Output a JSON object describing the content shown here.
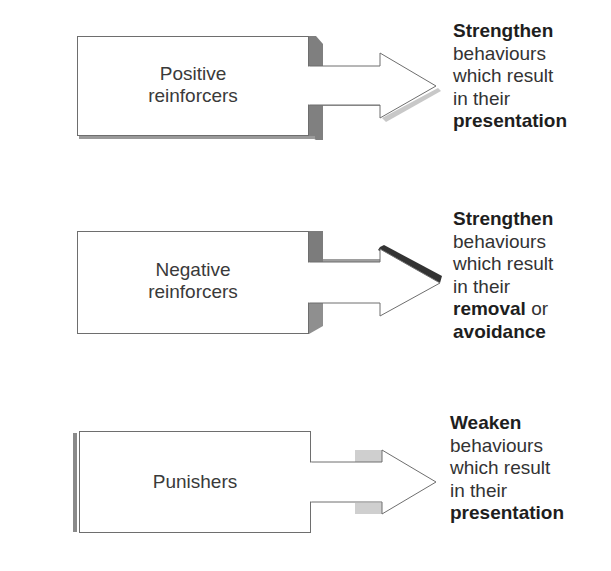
{
  "rows": [
    {
      "box_label_line1": "Positive",
      "box_label_line2": "reinforcers",
      "outcome": {
        "verb": "Strengthen",
        "line2": "behaviours",
        "line3": "which result",
        "line4": "in their",
        "object": "presentation",
        "suffix": ""
      }
    },
    {
      "box_label_line1": "Negative",
      "box_label_line2": "reinforcers",
      "outcome": {
        "verb": "Strengthen",
        "line2": "behaviours",
        "line3": "which result",
        "line4": "in their",
        "object": "removal",
        "suffix": " or",
        "object2": "avoidance"
      }
    },
    {
      "box_label_line1": "Punishers",
      "box_label_line2": "",
      "outcome": {
        "verb": "Weaken",
        "line2": "behaviours",
        "line3": "which result",
        "line4": "in their",
        "object": "presentation",
        "suffix": ""
      }
    }
  ],
  "colors": {
    "stroke": "#6e6e6e",
    "shadow_dark": "#7a7a7a",
    "shadow_light": "#bdbdbd",
    "shadow_pale": "#d0d0d0",
    "accent_dark": "#333333"
  }
}
